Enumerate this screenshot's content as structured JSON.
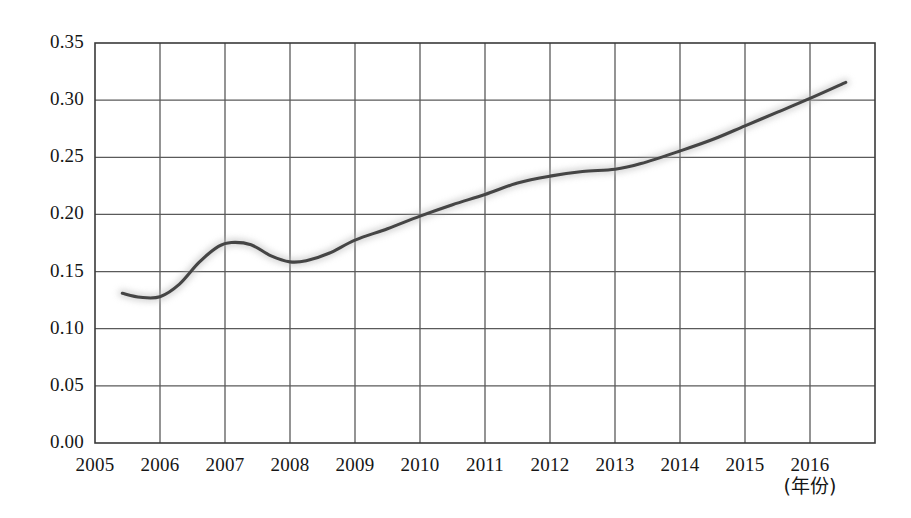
{
  "chart_data": {
    "type": "line",
    "title": "",
    "subtitle": "",
    "xlabel": "(年份)",
    "ylabel": "",
    "xlim": [
      2005,
      2016
    ],
    "ylim": [
      0.0,
      0.35
    ],
    "grid": true,
    "legend": "none",
    "x_tick_labels": [
      "2005",
      "2006",
      "2007",
      "2008",
      "2009",
      "2010",
      "2011",
      "2012",
      "2013",
      "2014",
      "2015",
      "2016"
    ],
    "y_tick_labels": [
      "0.00",
      "0.05",
      "0.10",
      "0.15",
      "0.20",
      "0.25",
      "0.30",
      "0.35"
    ],
    "y_ticks": [
      0.0,
      0.05,
      0.1,
      0.15,
      0.2,
      0.25,
      0.3,
      0.35
    ],
    "x": [
      2005,
      2006,
      2007,
      2008,
      2009,
      2010,
      2011,
      2012,
      2013,
      2014,
      2015,
      2016
    ],
    "series": [
      {
        "name": "比重",
        "color": "#454545",
        "values": [
          0.131,
          0.128,
          0.175,
          0.158,
          0.172,
          0.196,
          0.216,
          0.232,
          0.239,
          0.255,
          0.277,
          0.3
        ]
      }
    ],
    "annotations": [
      {
        "text": "曲线末端延伸至约 0.315",
        "x": 2016.5,
        "y": 0.315
      }
    ],
    "curve_points": [
      [
        2005.42,
        0.131
      ],
      [
        2005.7,
        0.1275
      ],
      [
        2006.0,
        0.128
      ],
      [
        2006.3,
        0.139
      ],
      [
        2006.6,
        0.158
      ],
      [
        2006.9,
        0.172
      ],
      [
        2007.1,
        0.1755
      ],
      [
        2007.4,
        0.1735
      ],
      [
        2007.7,
        0.164
      ],
      [
        2008.0,
        0.1585
      ],
      [
        2008.25,
        0.1595
      ],
      [
        2008.6,
        0.166
      ],
      [
        2009.0,
        0.1775
      ],
      [
        2009.5,
        0.1875
      ],
      [
        2010.0,
        0.1985
      ],
      [
        2010.5,
        0.2085
      ],
      [
        2011.0,
        0.2175
      ],
      [
        2011.5,
        0.2275
      ],
      [
        2012.0,
        0.2335
      ],
      [
        2012.5,
        0.2375
      ],
      [
        2013.0,
        0.2395
      ],
      [
        2013.4,
        0.2445
      ],
      [
        2014.0,
        0.2555
      ],
      [
        2014.5,
        0.2655
      ],
      [
        2015.0,
        0.2775
      ],
      [
        2015.5,
        0.2895
      ],
      [
        2016.0,
        0.3015
      ],
      [
        2016.55,
        0.3155
      ]
    ]
  },
  "axes": {
    "plot_left_px": 95,
    "plot_right_px": 875,
    "plot_top_px": 43,
    "plot_bottom_px": 443,
    "frame_color": "#3a3a3a",
    "grid_color": "#5a5a5a"
  }
}
